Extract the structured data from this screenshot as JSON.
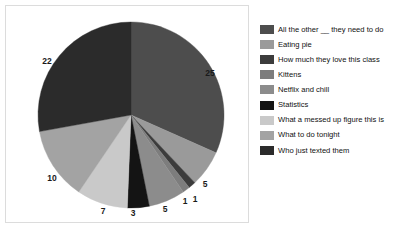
{
  "chart_data": {
    "type": "pie",
    "title": "",
    "subtitle": "",
    "xlabel": "",
    "ylabel": "",
    "grid": false,
    "legend_position": "right",
    "start_angle_deg": 0,
    "direction": "clockwise",
    "total": 79,
    "categories": [
      "All the other __ they need to do",
      "Eating pie",
      "How much they love this class",
      "Kittens",
      "Netflix and chill",
      "Statistics",
      "What a messed up figure this is",
      "What to do tonight",
      "Who just texted them"
    ],
    "values": [
      25,
      5,
      1,
      1,
      5,
      3,
      7,
      10,
      22
    ],
    "data_labels": [
      "25",
      "5",
      "1",
      "1",
      "5",
      "3",
      "7",
      "10",
      "22"
    ],
    "colors": [
      "#4d4d4d",
      "#9a9a9a",
      "#3c3c3c",
      "#7d7d7d",
      "#8c8c8c",
      "#141414",
      "#c9c9c9",
      "#a3a3a3",
      "#2b2b2b"
    ],
    "slices": [
      {
        "label": "All the other __ they need to do",
        "value": 25,
        "color": "#4d4d4d",
        "label_x": 204,
        "label_y": 67
      },
      {
        "label": "Eating pie",
        "value": 5,
        "color": "#9a9a9a",
        "label_x": 199,
        "label_y": 178
      },
      {
        "label": "How much they love this class",
        "value": 1,
        "color": "#3c3c3c",
        "label_x": 189,
        "label_y": 193
      },
      {
        "label": "Kittens",
        "value": 1,
        "color": "#7d7d7d",
        "label_x": 179,
        "label_y": 195
      },
      {
        "label": "Netflix and chill",
        "value": 5,
        "color": "#8c8c8c",
        "label_x": 159,
        "label_y": 203
      },
      {
        "label": "Statistics",
        "value": 3,
        "color": "#141414",
        "label_x": 127,
        "label_y": 207
      },
      {
        "label": "What a messed up figure this is",
        "value": 7,
        "color": "#c9c9c9",
        "label_x": 97,
        "label_y": 205
      },
      {
        "label": "What to do tonight",
        "value": 10,
        "color": "#a3a3a3",
        "label_x": 46,
        "label_y": 172
      },
      {
        "label": "Who just texted them",
        "value": 22,
        "color": "#2b2b2b",
        "label_x": 41,
        "label_y": 55
      }
    ],
    "geometry": {
      "cx": 125,
      "cy": 109,
      "r": 93
    }
  },
  "legend": {
    "items": [
      {
        "label": "All the other __ they need to do",
        "color": "#4d4d4d"
      },
      {
        "label": "Eating pie",
        "color": "#9a9a9a"
      },
      {
        "label": "How much they love this class",
        "color": "#3c3c3c"
      },
      {
        "label": "Kittens",
        "color": "#7d7d7d"
      },
      {
        "label": "Netflix and chill",
        "color": "#8c8c8c"
      },
      {
        "label": "Statistics",
        "color": "#141414"
      },
      {
        "label": "What a messed up figure this is",
        "color": "#c9c9c9"
      },
      {
        "label": "What to do tonight",
        "color": "#a3a3a3"
      },
      {
        "label": "Who just texted them",
        "color": "#2b2b2b"
      }
    ]
  }
}
